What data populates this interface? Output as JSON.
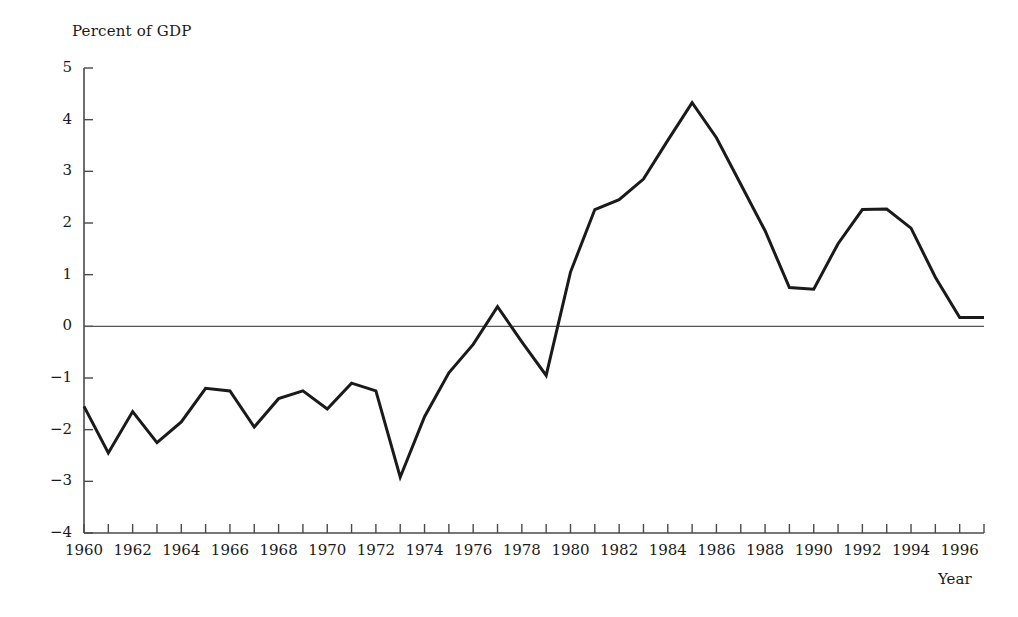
{
  "chart_data": {
    "type": "line",
    "title": "Percent of GDP",
    "subtitle": "",
    "xlabel": "Year",
    "ylabel": "Percent of GDP",
    "ylim": [
      -4,
      5
    ],
    "xlim": [
      1960,
      1997
    ],
    "grid": false,
    "legend": false,
    "zero_line": true,
    "y_ticks": [
      5,
      4,
      3,
      2,
      1,
      0,
      -1,
      -2,
      -3,
      -4
    ],
    "y_tick_labels": [
      "5",
      "4",
      "3",
      "2",
      "1",
      "0",
      "−1",
      "−2",
      "−3",
      "−4"
    ],
    "x_ticks": [
      1960,
      1961,
      1962,
      1963,
      1964,
      1965,
      1966,
      1967,
      1968,
      1969,
      1970,
      1971,
      1972,
      1973,
      1974,
      1975,
      1976,
      1977,
      1978,
      1979,
      1980,
      1981,
      1982,
      1983,
      1984,
      1985,
      1986,
      1987,
      1988,
      1989,
      1990,
      1991,
      1992,
      1993,
      1994,
      1995,
      1996,
      1997
    ],
    "x_tick_labels": [
      "1960",
      "1962",
      "1964",
      "1966",
      "1968",
      "1970",
      "1972",
      "1974",
      "1976",
      "1978",
      "1980",
      "1982",
      "1984",
      "1986",
      "1988",
      "1990",
      "1992",
      "1994",
      "1996"
    ],
    "x_tick_label_years": [
      1960,
      1962,
      1964,
      1966,
      1968,
      1970,
      1972,
      1974,
      1976,
      1978,
      1980,
      1982,
      1984,
      1986,
      1988,
      1990,
      1992,
      1994,
      1996
    ],
    "series": [
      {
        "name": "Deficit as percent of GDP",
        "color": "#1a1a1a",
        "line_width": 3,
        "x": [
          1960,
          1961,
          1962,
          1963,
          1964,
          1965,
          1966,
          1967,
          1968,
          1969,
          1970,
          1971,
          1972,
          1973,
          1974,
          1975,
          1976,
          1977,
          1978,
          1979,
          1980,
          1981,
          1982,
          1983,
          1984,
          1985,
          1986,
          1987,
          1988,
          1989,
          1990,
          1991,
          1992,
          1993,
          1994,
          1995,
          1996,
          1997
        ],
        "y": [
          -1.55,
          -2.45,
          -1.65,
          -2.25,
          -1.85,
          -1.2,
          -1.25,
          -1.95,
          -1.4,
          -1.25,
          -1.6,
          -1.1,
          -1.25,
          -2.92,
          -1.75,
          -0.9,
          -0.35,
          0.38,
          -0.3,
          -0.95,
          1.05,
          2.26,
          2.45,
          2.85,
          3.6,
          4.33,
          3.65,
          2.75,
          1.85,
          0.75,
          0.72,
          1.6,
          2.26,
          2.27,
          1.9,
          0.95,
          0.17,
          0.17
        ]
      }
    ],
    "annotations": []
  },
  "axis": {
    "y_axis_label": "Percent of GDP",
    "x_axis_label": "Year",
    "zero_line_color": "#555555",
    "axis_color": "#4a4a4a"
  }
}
